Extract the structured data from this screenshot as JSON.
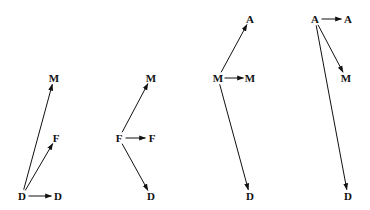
{
  "diagrams": [
    {
      "id": "diagram-1",
      "nodes": [
        {
          "key": "src",
          "label": "D",
          "x": 22,
          "y": 196
        },
        {
          "key": "n1",
          "label": "D",
          "x": 58,
          "y": 196
        },
        {
          "key": "n2",
          "label": "M",
          "x": 54,
          "y": 78
        },
        {
          "key": "n3",
          "label": "F",
          "x": 56,
          "y": 138
        }
      ],
      "edges": [
        {
          "from": "src",
          "to": "n1"
        },
        {
          "from": "src",
          "to": "n2"
        },
        {
          "from": "src",
          "to": "n3"
        }
      ]
    },
    {
      "id": "diagram-2",
      "nodes": [
        {
          "key": "src",
          "label": "F",
          "x": 119,
          "y": 138
        },
        {
          "key": "n1",
          "label": "F",
          "x": 152,
          "y": 138
        },
        {
          "key": "n2",
          "label": "M",
          "x": 151,
          "y": 78
        },
        {
          "key": "n3",
          "label": "D",
          "x": 151,
          "y": 196
        }
      ],
      "edges": [
        {
          "from": "src",
          "to": "n1"
        },
        {
          "from": "src",
          "to": "n2"
        },
        {
          "from": "src",
          "to": "n3"
        }
      ]
    },
    {
      "id": "diagram-3",
      "nodes": [
        {
          "key": "src",
          "label": "M",
          "x": 218,
          "y": 78
        },
        {
          "key": "n1",
          "label": "M",
          "x": 250,
          "y": 78
        },
        {
          "key": "n2",
          "label": "A",
          "x": 250,
          "y": 19
        },
        {
          "key": "n3",
          "label": "D",
          "x": 250,
          "y": 196
        }
      ],
      "edges": [
        {
          "from": "src",
          "to": "n1"
        },
        {
          "from": "src",
          "to": "n2"
        },
        {
          "from": "src",
          "to": "n3"
        }
      ]
    },
    {
      "id": "diagram-4",
      "nodes": [
        {
          "key": "src",
          "label": "A",
          "x": 315,
          "y": 19
        },
        {
          "key": "n1",
          "label": "A",
          "x": 348,
          "y": 19
        },
        {
          "key": "n2",
          "label": "M",
          "x": 346,
          "y": 78
        },
        {
          "key": "n3",
          "label": "D",
          "x": 348,
          "y": 196
        }
      ],
      "edges": [
        {
          "from": "src",
          "to": "n1"
        },
        {
          "from": "src",
          "to": "n2"
        },
        {
          "from": "src",
          "to": "n3"
        }
      ]
    }
  ],
  "colors": {
    "stroke": "#111111",
    "text": "#111111",
    "background": "#ffffff"
  }
}
